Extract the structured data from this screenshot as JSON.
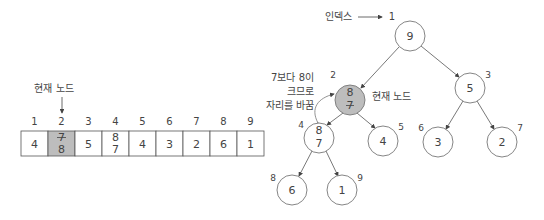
{
  "array": {
    "current_node_label": "현재 노드",
    "indices": [
      "1",
      "2",
      "3",
      "4",
      "5",
      "6",
      "7",
      "8",
      "9"
    ],
    "cells": [
      {
        "top": "4",
        "bottom": "",
        "highlight": false
      },
      {
        "top": "7",
        "bottom": "8",
        "struck_top": true,
        "highlight": true
      },
      {
        "top": "5",
        "bottom": "",
        "highlight": false
      },
      {
        "top": "8",
        "bottom": "7",
        "struck_top": false,
        "highlight": false
      },
      {
        "top": "4",
        "bottom": "",
        "highlight": false
      },
      {
        "top": "3",
        "bottom": "",
        "highlight": false
      },
      {
        "top": "2",
        "bottom": "",
        "highlight": false
      },
      {
        "top": "6",
        "bottom": "",
        "highlight": false
      },
      {
        "top": "1",
        "bottom": "",
        "highlight": false
      }
    ],
    "highlight_color": "#bdbdbd"
  },
  "tree": {
    "index_label": "인덱스",
    "index_label_target": "1",
    "current_node_label": "현재 노드",
    "swap_note_lines": [
      "7보다 8이",
      "크므로",
      "자리를 바꿈"
    ],
    "nodes": [
      {
        "index": "1",
        "value": "9",
        "value2": ""
      },
      {
        "index": "2",
        "value": "8",
        "value2": "7",
        "struck_value2": true,
        "highlight": true
      },
      {
        "index": "3",
        "value": "5",
        "value2": ""
      },
      {
        "index": "4",
        "value": "8",
        "value2": "7"
      },
      {
        "index": "5",
        "value": "4",
        "value2": ""
      },
      {
        "index": "6",
        "value": "3",
        "value2": ""
      },
      {
        "index": "7",
        "value": "2",
        "value2": ""
      },
      {
        "index": "8",
        "value": "6",
        "value2": ""
      },
      {
        "index": "9",
        "value": "1",
        "value2": ""
      }
    ]
  }
}
